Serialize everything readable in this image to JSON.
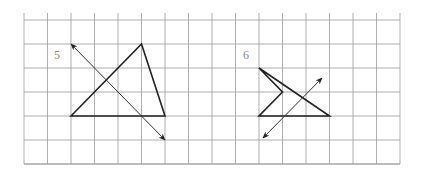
{
  "grid": {
    "x0": 24,
    "y0": 20,
    "step": 23.5,
    "cols": 16,
    "rows": 6,
    "top_extend": 13,
    "bottom": 164,
    "line_color": "#9a9a9a"
  },
  "figures": [
    {
      "label": "5",
      "label_pos": [
        54,
        49
      ],
      "shape": "triangle",
      "points": [
        [
          71,
          116
        ],
        [
          141.5,
          44
        ],
        [
          165,
          116
        ]
      ],
      "axis": {
        "from": [
          71,
          44
        ],
        "to": [
          165,
          140
        ],
        "type": "double-arrow"
      }
    },
    {
      "label": "6",
      "label_pos": [
        243,
        49
      ],
      "shape": "concave-quadrilateral",
      "points": [
        [
          259,
          68
        ],
        [
          329.5,
          116
        ],
        [
          259,
          116
        ],
        [
          282.5,
          92
        ]
      ],
      "axis": {
        "from": [
          263,
          138
        ],
        "to": [
          322,
          78
        ],
        "type": "double-arrow"
      }
    }
  ],
  "colors": {
    "shape": "#222222",
    "axis": "#333333",
    "label": "#8a8a8a"
  }
}
